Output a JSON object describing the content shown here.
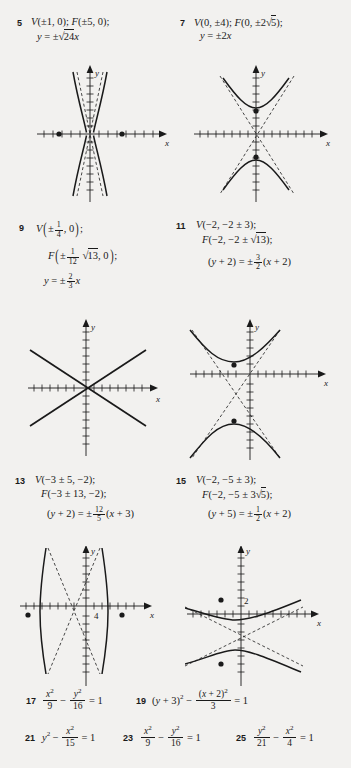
{
  "page": {
    "kind": "textbook-answer-key",
    "background": "#f2f1ef",
    "ink": "#1a1a1a"
  },
  "answers": [
    {
      "number": "5",
      "lines": [
        "V(±1, 0); F(±5, 0);",
        "y = ±√24x"
      ]
    },
    {
      "number": "7",
      "lines": [
        "V(0, ±4); F(0, ±2√5);",
        "y = ±2x"
      ]
    },
    {
      "number": "9",
      "lines": [
        "V(±1/4, 0);",
        "F(±(1/12)√13, 0);",
        "y = ±(2/3)x"
      ]
    },
    {
      "number": "11",
      "lines": [
        "V(−2, −2 ± 3);",
        "F(−2, −2 ± √13);",
        "(y + 2) = ±(3/2)(x + 2)"
      ]
    },
    {
      "number": "13",
      "lines": [
        "V(−3 ± 5, −2);",
        "F(−3 ± 13, −2);",
        "(y + 2) = ±(12/5)(x + 3)"
      ]
    },
    {
      "number": "15",
      "lines": [
        "V(−2, −5 ± 3);",
        "F(−2, −5 ± 3√5);",
        "(y + 5) = ±(1/2)(x + 2)"
      ]
    },
    {
      "number": "17",
      "lines": [
        "x²/9 − y²/16 = 1"
      ]
    },
    {
      "number": "19",
      "lines": [
        "(y + 3)² − (x + 2)²/3 = 1"
      ]
    },
    {
      "number": "21",
      "lines": [
        "y² − x²/15 = 1"
      ]
    },
    {
      "number": "23",
      "lines": [
        "x²/9 − y²/16 = 1"
      ]
    },
    {
      "number": "25",
      "lines": [
        "y²/21 − x²/4 = 1"
      ]
    }
  ],
  "graphs": [
    {
      "id": "graph-5",
      "for_problem": "5",
      "axis_labels": {
        "x": "x",
        "y": "y"
      },
      "type": "hyperbola-vertical-narrow",
      "tick_labels": [],
      "foci_marked": true,
      "asymptotes": "dashed"
    },
    {
      "id": "graph-7",
      "for_problem": "7",
      "axis_labels": {
        "x": "x",
        "y": "y"
      },
      "type": "hyperbola-vertical",
      "tick_labels": [],
      "foci_marked": true,
      "asymptotes": "dashed"
    },
    {
      "id": "graph-9",
      "for_problem": "9",
      "axis_labels": {
        "x": "x",
        "y": "y"
      },
      "type": "degenerate-crossing-lines",
      "tick_labels": [],
      "foci_marked": false,
      "asymptotes": "none"
    },
    {
      "id": "graph-11",
      "for_problem": "11",
      "axis_labels": {
        "x": "x",
        "y": "y"
      },
      "type": "hyperbola-vertical-shifted",
      "tick_labels": [],
      "foci_marked": true,
      "asymptotes": "dashed"
    },
    {
      "id": "graph-13",
      "for_problem": "13",
      "axis_labels": {
        "x": "x",
        "y": "y"
      },
      "type": "hyperbola-horizontal-shifted",
      "tick_labels": [
        "4"
      ],
      "foci_marked": true,
      "asymptotes": "dashed"
    },
    {
      "id": "graph-15",
      "for_problem": "15",
      "axis_labels": {
        "x": "x",
        "y": "y"
      },
      "type": "hyperbola-vertical-wide-shifted",
      "tick_labels": [
        "2"
      ],
      "foci_marked": true,
      "asymptotes": "dashed"
    }
  ]
}
